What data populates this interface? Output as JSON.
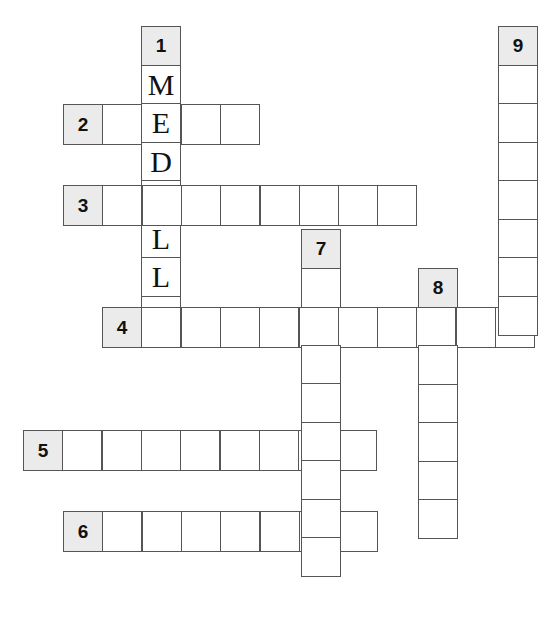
{
  "puzzle": {
    "type": "crossword",
    "cell_size": 39,
    "colors": {
      "clue_bg": "#ebebeb",
      "cell_bg": "#ffffff",
      "border": "#555555"
    },
    "words": [
      {
        "number": "1",
        "direction": "down",
        "x": 141,
        "y": 26,
        "length": 8,
        "clue_cell": true,
        "letters": [
          "",
          "M",
          "E",
          "D",
          "A",
          "L",
          "L",
          "A"
        ]
      },
      {
        "number": "2",
        "direction": "across",
        "x": 63,
        "y": 104,
        "length": 5,
        "clue_cell": true,
        "letters": [
          "",
          "",
          "",
          "",
          ""
        ]
      },
      {
        "number": "3",
        "direction": "across",
        "x": 63,
        "y": 185,
        "length": 9,
        "clue_cell": true,
        "letters": [
          "",
          "",
          "",
          "",
          "",
          "",
          "",
          "",
          ""
        ]
      },
      {
        "number": "4",
        "direction": "across",
        "x": 102,
        "y": 307,
        "length": 11,
        "clue_cell": true,
        "letters": [
          "",
          "",
          "",
          "",
          "",
          "",
          "",
          "",
          "",
          "",
          ""
        ]
      },
      {
        "number": "5",
        "direction": "across",
        "x": 23,
        "y": 430,
        "length": 9,
        "clue_cell": true,
        "letters": [
          "",
          "",
          "",
          "",
          "",
          "",
          "",
          "",
          ""
        ]
      },
      {
        "number": "6",
        "direction": "across",
        "x": 63,
        "y": 511,
        "length": 8,
        "clue_cell": true,
        "letters": [
          "",
          "",
          "",
          "",
          "",
          "",
          "",
          ""
        ]
      },
      {
        "number": "7",
        "direction": "down",
        "x": 301,
        "y": 229,
        "length": 9,
        "clue_cell": true,
        "letters": [
          "",
          "",
          "",
          "",
          "",
          "",
          "",
          "",
          ""
        ]
      },
      {
        "number": "8",
        "direction": "down",
        "x": 418,
        "y": 268,
        "length": 7,
        "clue_cell": true,
        "letters": [
          "",
          "",
          "",
          "",
          "",
          "",
          ""
        ]
      },
      {
        "number": "9",
        "direction": "down",
        "x": 498,
        "y": 26,
        "length": 8,
        "clue_cell": true,
        "letters": [
          "",
          "",
          "",
          "",
          "",
          "",
          "",
          ""
        ]
      }
    ],
    "solved_word": {
      "number": "1",
      "text": "MEDALLA"
    }
  }
}
